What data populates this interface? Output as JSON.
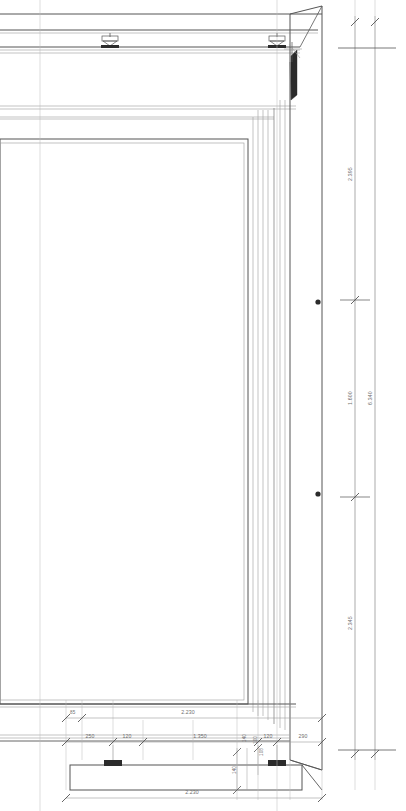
{
  "drawing": {
    "type": "architectural-section",
    "title": "Vertical section – glazed facade frame",
    "units": "m / mm",
    "line_color": "#555555",
    "thin_line_color": "#9a9a9a",
    "dim_color": "#6e6e6e",
    "fixture_color": "#2b2b2b",
    "background": "#ffffff"
  },
  "dimensions": {
    "vertical_right_chain": [
      {
        "id": "v1",
        "label": "2.395",
        "from_y": 48,
        "to_y": 300
      },
      {
        "id": "v2",
        "label": "1.600",
        "from_y": 300,
        "to_y": 497
      },
      {
        "id": "v3",
        "label": "2.345",
        "from_y": 497,
        "to_y": 750
      }
    ],
    "vertical_overall": {
      "id": "v-total",
      "label": "6.340",
      "from_y": 48,
      "to_y": 750
    },
    "horizontal_upper_chain": [
      {
        "id": "h-85",
        "label": "85"
      },
      {
        "id": "h-2230",
        "label": "2.230"
      }
    ],
    "horizontal_mid_chain": [
      {
        "id": "h-250",
        "label": "250"
      },
      {
        "id": "h-120a",
        "label": "120"
      },
      {
        "id": "h-1350",
        "label": "1.350"
      },
      {
        "id": "h-120b",
        "label": "120"
      },
      {
        "id": "h-290",
        "label": "290"
      }
    ],
    "horizontal_bottom": {
      "id": "h-total",
      "label": "2.230"
    },
    "small_vertical": [
      {
        "id": "s-140a",
        "label": "140"
      },
      {
        "id": "s-140b",
        "label": "140"
      },
      {
        "id": "s-100",
        "label": "100"
      },
      {
        "id": "s-108",
        "label": "108"
      }
    ]
  },
  "elements": {
    "ceiling_brackets": [
      {
        "id": "bracket-left",
        "name": "ceiling-mount-bracket",
        "x": 110,
        "y": 40
      },
      {
        "id": "bracket-right",
        "name": "ceiling-mount-bracket",
        "x": 277,
        "y": 40
      }
    ],
    "column_fixings": [
      {
        "id": "fix-upper",
        "name": "column-fixing-point",
        "x": 318,
        "y": 302
      },
      {
        "id": "fix-lower",
        "name": "column-fixing-point",
        "x": 318,
        "y": 494
      }
    ],
    "base_plates": [
      {
        "id": "base-left",
        "name": "base-anchor-block",
        "x": 112,
        "y": 762
      },
      {
        "id": "base-right",
        "name": "base-anchor-block",
        "x": 276,
        "y": 762
      }
    ],
    "corners": [
      {
        "id": "corner-top-right",
        "name": "mitred-corner-joint"
      },
      {
        "id": "corner-bottom-right",
        "name": "mitred-corner-joint"
      }
    ]
  }
}
